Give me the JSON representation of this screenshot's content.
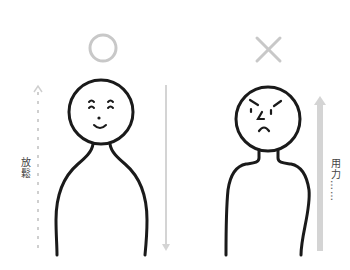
{
  "left_panel": {
    "verdict_symbol": "circle",
    "verdict_meaning": "correct",
    "expression": "relaxed-smile",
    "side_label": "放鬆",
    "arrow_direction": "down"
  },
  "right_panel": {
    "verdict_symbol": "cross",
    "verdict_meaning": "incorrect",
    "expression": "angry-frown",
    "side_label": "用力……",
    "arrow_direction": "up"
  },
  "colors": {
    "line": "#1a1a1a",
    "symbol_gray": "#c8c8c8",
    "arrow_gray": "#d4d4d4",
    "text": "#444444",
    "background": "#ffffff"
  }
}
